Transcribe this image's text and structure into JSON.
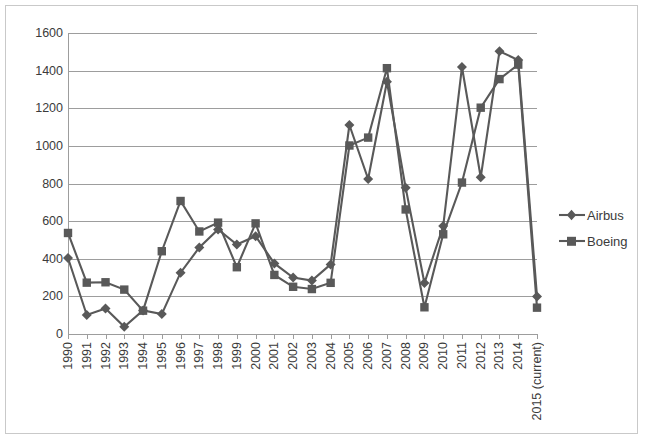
{
  "chart_data": {
    "type": "line",
    "title": "",
    "xlabel": "",
    "ylabel": "",
    "ylim": [
      0,
      1600
    ],
    "ytick_step": 200,
    "yticks": [
      0,
      200,
      400,
      600,
      800,
      1000,
      1200,
      1400,
      1600
    ],
    "grid": true,
    "legend_position": "right",
    "categories": [
      "1990",
      "1991",
      "1992",
      "1993",
      "1994",
      "1995",
      "1996",
      "1997",
      "1998",
      "1999",
      "2000",
      "2001",
      "2002",
      "2003",
      "2004",
      "2005",
      "2006",
      "2007",
      "2008",
      "2009",
      "2010",
      "2011",
      "2012",
      "2013",
      "2014",
      "2015 (current)"
    ],
    "series": [
      {
        "name": "Airbus",
        "marker": "diamond",
        "color": "#595959",
        "values": [
          404,
          101,
          136,
          38,
          125,
          106,
          326,
          460,
          556,
          476,
          520,
          375,
          300,
          284,
          370,
          1111,
          824,
          1341,
          777,
          271,
          574,
          1419,
          833,
          1503,
          1456,
          200
        ]
      },
      {
        "name": "Boeing",
        "marker": "square",
        "color": "#595959",
        "values": [
          537,
          273,
          275,
          236,
          124,
          440,
          707,
          545,
          592,
          355,
          588,
          314,
          251,
          239,
          272,
          1002,
          1044,
          1413,
          662,
          142,
          530,
          805,
          1203,
          1355,
          1432,
          140
        ]
      }
    ]
  },
  "legend": {
    "items": [
      {
        "label": "Airbus",
        "marker": "diamond-icon"
      },
      {
        "label": "Boeing",
        "marker": "square-icon"
      }
    ]
  },
  "colors": {
    "series": "#595959",
    "gridline": "#9d9d9d",
    "border": "#c9c9c9",
    "text": "#3b3b3b",
    "background": "#ffffff"
  }
}
